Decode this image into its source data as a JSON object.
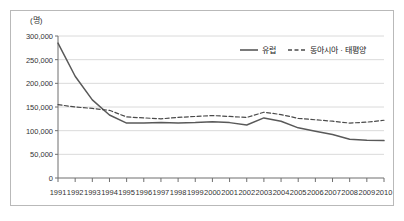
{
  "chart_data": {
    "type": "line",
    "title": "",
    "subtitle": "",
    "xlabel": "",
    "ylabel": "",
    "unit_label": "(명)",
    "grid": true,
    "legend_position": "top-right",
    "x": [
      1991,
      1992,
      1993,
      1994,
      1995,
      1996,
      1997,
      1998,
      1999,
      2000,
      2001,
      2002,
      2003,
      2004,
      2005,
      2006,
      2007,
      2008,
      2009,
      2010
    ],
    "categories": [
      "1991",
      "1992",
      "1993",
      "1994",
      "1995",
      "1996",
      "1997",
      "1998",
      "1999",
      "2000",
      "2001",
      "2002",
      "2003",
      "2004",
      "2005",
      "2006",
      "2007",
      "2008",
      "2009",
      "2010"
    ],
    "ylim": [
      0,
      300000
    ],
    "yticks": [
      0,
      50000,
      100000,
      150000,
      200000,
      250000,
      300000
    ],
    "ytick_labels": [
      "0",
      "50,000",
      "100,000",
      "150,000",
      "200,000",
      "250,000",
      "300,000"
    ],
    "series": [
      {
        "name": "유럽",
        "style": "solid",
        "color": "#595959",
        "values": [
          285000,
          215000,
          165000,
          133000,
          116000,
          116000,
          117000,
          116000,
          117000,
          119000,
          117000,
          112000,
          127000,
          120000,
          106000,
          99000,
          92000,
          82000,
          80000,
          79000
        ]
      },
      {
        "name": "동아시아 · 태평양",
        "style": "dashed",
        "color": "#4a4a4a",
        "values": [
          155000,
          150000,
          147000,
          143000,
          129000,
          127000,
          125000,
          128000,
          130000,
          132000,
          130000,
          128000,
          139000,
          134000,
          126000,
          123000,
          120000,
          116000,
          118000,
          122000
        ]
      }
    ]
  },
  "legend": {
    "items": [
      {
        "label": "유럽",
        "style": "solid"
      },
      {
        "label": "동아시아 · 태평양",
        "style": "dashed"
      }
    ]
  }
}
